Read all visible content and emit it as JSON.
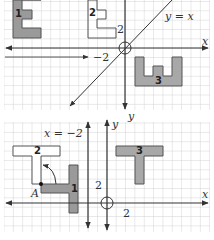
{
  "colors": {
    "grid": "#c9c9c9",
    "axis": "#333333",
    "shape_fill": "#9a9a9a",
    "shape_outline": "#555555",
    "background": "#ffffff"
  },
  "top_graph": {
    "axis_x_label": "x",
    "line_label": "y = x",
    "figures": [
      {
        "id": "1",
        "label": "1",
        "shape": "E",
        "filled": true
      },
      {
        "id": "2",
        "label": "2",
        "shape": "E",
        "filled": false
      },
      {
        "id": "3",
        "label": "3",
        "shape": "U",
        "filled": true
      }
    ],
    "dimension_label_1": "2",
    "translation_label": "−2"
  },
  "bottom_graph": {
    "axis_x_label": "x",
    "axis_y_label": "y",
    "line_label": "x = −2",
    "point_label": "A",
    "figures": [
      {
        "id": "1",
        "label": "1",
        "shape": "L",
        "filled": true
      },
      {
        "id": "2",
        "label": "2",
        "shape": "T",
        "filled": false
      },
      {
        "id": "3",
        "label": "3",
        "shape": "T",
        "filled": true
      }
    ],
    "dimension_label_y": "2",
    "dimension_label_x": "2"
  }
}
